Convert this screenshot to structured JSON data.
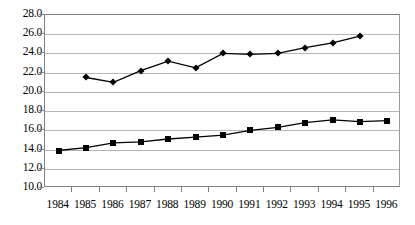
{
  "chart_data": {
    "type": "line",
    "title": "",
    "xlabel": "",
    "ylabel": "",
    "categories": [
      "1984",
      "1985",
      "1986",
      "1987",
      "1988",
      "1989",
      "1990",
      "1991",
      "1992",
      "1993",
      "1994",
      "1995",
      "1996"
    ],
    "ylim": [
      10.0,
      28.0
    ],
    "y_ticks": [
      "10.0",
      "12.0",
      "14.0",
      "16.0",
      "18.0",
      "20.0",
      "22.0",
      "24.0",
      "26.0",
      "28.0"
    ],
    "y_tick_values": [
      10.0,
      12.0,
      14.0,
      16.0,
      18.0,
      20.0,
      22.0,
      24.0,
      26.0,
      28.0
    ],
    "grid": "horizontal",
    "legend": "none",
    "series": [
      {
        "name": "upper-series",
        "marker": "diamond",
        "color": "#000000",
        "values": [
          null,
          21.5,
          21.0,
          22.2,
          23.2,
          22.5,
          24.0,
          23.9,
          24.0,
          24.6,
          25.1,
          25.8,
          null
        ]
      },
      {
        "name": "lower-series",
        "marker": "square",
        "color": "#000000",
        "values": [
          13.9,
          14.2,
          14.7,
          14.8,
          15.1,
          15.3,
          15.5,
          16.0,
          16.3,
          16.8,
          17.1,
          16.9,
          17.0
        ]
      }
    ]
  }
}
